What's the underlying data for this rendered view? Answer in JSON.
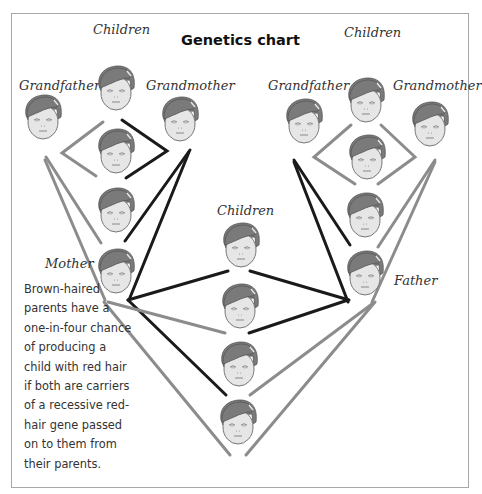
{
  "title": "Genetics chart",
  "labels": {
    "left_grandfather": "Grandfather",
    "left_children": "Children",
    "left_grandmother": "Grandmother",
    "right_grandfather": "Grandfather",
    "right_children": "Children",
    "right_grandmother": "Grandmother",
    "center_children": "Children",
    "mother": "Mother",
    "father": "Father"
  },
  "caption": {
    "lines": [
      "Brown-haired",
      "parents have a",
      "one-in-four chance",
      "of producing a",
      "child with red hair",
      "if both are carriers",
      "of a recessive red-",
      "hair gene passed",
      "on to them from",
      "their parents."
    ]
  },
  "colors": {
    "dark_line": "#1a1a1a",
    "light_line": "#8c8c8c",
    "hair": "#7a7a7a",
    "skin": "#e6e6e6",
    "frame": "#a8a8a8"
  },
  "diagram": {
    "families": [
      {
        "name": "left_grandparents",
        "grandfather": "left_grandfather",
        "grandmother": "left_grandmother",
        "children": [
          "left_child_1",
          "left_child_2",
          "left_child_3",
          "mother"
        ]
      },
      {
        "name": "right_grandparents",
        "grandfather": "right_grandfather",
        "grandmother": "right_grandmother",
        "children": [
          "right_child_1",
          "right_child_2",
          "right_child_3",
          "father"
        ]
      },
      {
        "name": "parents",
        "parents": [
          "mother",
          "father"
        ],
        "children": [
          "center_child_1",
          "center_child_2",
          "center_child_3",
          "center_child_4"
        ]
      }
    ]
  }
}
